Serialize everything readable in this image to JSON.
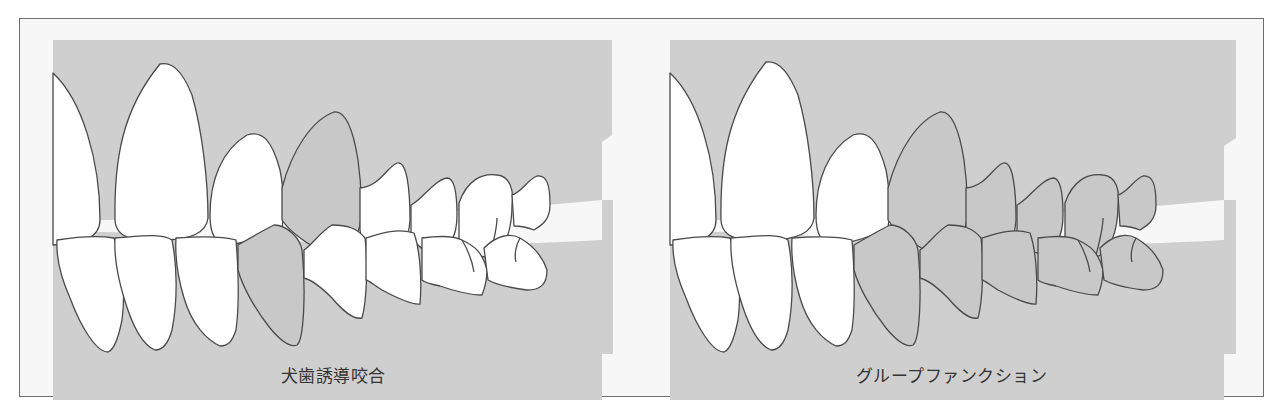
{
  "figure": {
    "panels": [
      {
        "id": "canine-guidance",
        "caption": "犬歯誘導咬合",
        "caption_en": null,
        "highlighted_teeth": [
          "upper-canine",
          "lower-canine"
        ]
      },
      {
        "id": "group-function",
        "caption": "グループファンクション",
        "highlighted_teeth": [
          "upper-canine",
          "upper-premolar-1",
          "upper-premolar-2",
          "upper-molar-1",
          "upper-molar-2",
          "lower-canine",
          "lower-premolar-1",
          "lower-premolar-2",
          "lower-molar-1",
          "lower-molar-2"
        ]
      }
    ],
    "colors": {
      "background": "#f7f7f7",
      "gum": "#cfcfcf",
      "tooth_plain": "#ffffff",
      "tooth_contact": "#c8c8c8",
      "outline": "#4a4a4a",
      "frame": "#6e6e6e",
      "caption": "#333333"
    }
  }
}
